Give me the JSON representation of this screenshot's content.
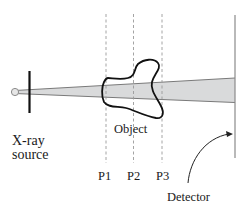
{
  "diagram": {
    "type": "x-ray projection schematic",
    "labels": {
      "source": "X-ray source",
      "source_line1": "X-ray",
      "source_line2": "source",
      "object": "Object",
      "planes": [
        "P1",
        "P2",
        "P3"
      ],
      "detector": "Detector"
    },
    "colors": {
      "beam_fill": "#d9dadb",
      "beam_edge": "#7a7a7a",
      "object_outline": "#111111",
      "dashed_planes": "#9a9a9a",
      "detector_line": "#8a8a8a",
      "collimator": "#111111",
      "text": "#1a1a1a"
    }
  }
}
